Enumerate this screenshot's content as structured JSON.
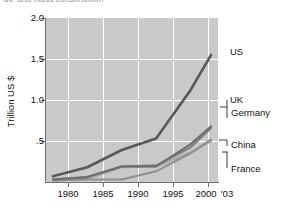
{
  "title_fragment": "ay, and mass consumption",
  "axes": {
    "y_title": "Trillion US $",
    "y_ticks": [
      "2.0",
      "1.5",
      "1.0",
      ".5"
    ],
    "y_tick_values": [
      2.0,
      1.5,
      1.0,
      0.5
    ],
    "x_ticks": [
      "1980",
      "1985",
      "1990",
      "1995",
      "2000",
      "'03"
    ],
    "x_tick_values": [
      1980,
      1985,
      1990,
      1995,
      2000,
      2003
    ]
  },
  "colors": {
    "plot_background": "#c9c9c9",
    "gridline": "#ffffff",
    "axis": "#6f6f6f",
    "us_line": "#585858",
    "uk_line": "#6e6e6e",
    "germany_line": "#7e7e7e",
    "china_line": "#8f8f8f",
    "france_line": "#a8a8a8",
    "text": "#111111"
  },
  "series_labels": {
    "us": "US",
    "uk": "UK",
    "germany": "Germany",
    "china": "China",
    "france": "France"
  },
  "chart_data": {
    "type": "line",
    "title": "",
    "xlabel": "",
    "ylabel": "Trillion US $",
    "xlim": [
      1979,
      2004
    ],
    "ylim": [
      0,
      2.0
    ],
    "grid": true,
    "legend_position": "right-inline-labels",
    "x": [
      1980,
      1985,
      1990,
      1995,
      2000,
      2003
    ],
    "series": [
      {
        "name": "US",
        "values": [
          0.07,
          0.18,
          0.39,
          0.53,
          1.12,
          1.55
        ]
      },
      {
        "name": "UK",
        "values": [
          0.03,
          0.06,
          0.19,
          0.19,
          0.46,
          0.68
        ]
      },
      {
        "name": "Germany",
        "values": [
          0.03,
          0.06,
          0.19,
          0.2,
          0.42,
          0.66
        ]
      },
      {
        "name": "China",
        "values": [
          0.02,
          0.03,
          0.03,
          0.13,
          0.35,
          0.52
        ]
      },
      {
        "name": "France",
        "values": [
          0.02,
          0.04,
          0.18,
          0.19,
          0.36,
          0.5
        ]
      }
    ]
  }
}
